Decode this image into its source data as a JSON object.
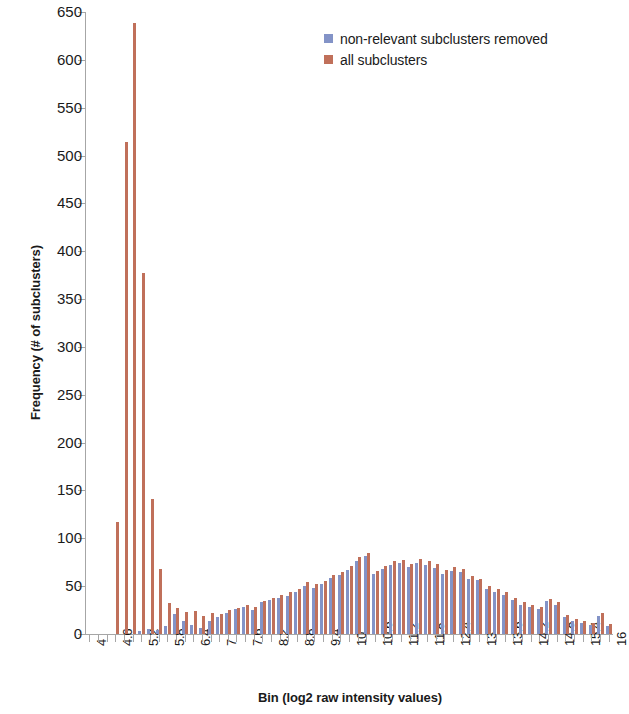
{
  "chart_data": {
    "type": "bar",
    "title": "",
    "xlabel": "Bin (log2 raw intensity values)",
    "ylabel": "Frequency (# of subclusters)",
    "ylim": [
      0,
      650
    ],
    "ytick_step": 50,
    "yticks": [
      0,
      50,
      100,
      150,
      200,
      250,
      300,
      350,
      400,
      450,
      500,
      550,
      600,
      650
    ],
    "grid": false,
    "legend_position": "top-center-right",
    "bin_start": 4.0,
    "bin_step": 0.2,
    "xtick_label_every": 3,
    "xtick_labels": [
      "4",
      "4.6",
      "5.2",
      "5.8",
      "6.4",
      "7",
      "7.6",
      "8.2",
      "8.8",
      "9.4",
      "10",
      "10.6",
      "11.2",
      "11.8",
      "12.4",
      "13",
      "13.6",
      "14.2",
      "14.8",
      "15.4",
      "16"
    ],
    "categories": [
      "4",
      "4.2",
      "4.4",
      "4.6",
      "4.8",
      "5",
      "5.2",
      "5.4",
      "5.6",
      "5.8",
      "6",
      "6.2",
      "6.4",
      "6.6",
      "6.8",
      "7",
      "7.2",
      "7.4",
      "7.6",
      "7.8",
      "8",
      "8.2",
      "8.4",
      "8.6",
      "8.8",
      "9",
      "9.2",
      "9.4",
      "9.6",
      "9.8",
      "10",
      "10.2",
      "10.4",
      "10.6",
      "10.8",
      "11",
      "11.2",
      "11.4",
      "11.6",
      "11.8",
      "12",
      "12.2",
      "12.4",
      "12.6",
      "12.8",
      "13",
      "13.2",
      "13.4",
      "13.6",
      "13.8",
      "14",
      "14.2",
      "14.4",
      "14.6",
      "14.8",
      "15",
      "15.2",
      "15.4",
      "15.6",
      "15.8",
      "16"
    ],
    "series": [
      {
        "name": "non-relevant subclusters removed",
        "color": "#8393c7",
        "values": [
          0,
          0,
          0,
          0,
          0,
          0,
          3,
          5,
          4,
          8,
          21,
          14,
          9,
          6,
          14,
          18,
          22,
          26,
          28,
          25,
          33,
          36,
          38,
          40,
          44,
          50,
          48,
          52,
          59,
          62,
          67,
          76,
          82,
          63,
          68,
          72,
          74,
          70,
          74,
          72,
          69,
          63,
          66,
          65,
          58,
          56,
          47,
          44,
          41,
          36,
          30,
          28,
          26,
          34,
          30,
          18,
          14,
          12,
          9,
          19,
          8
        ]
      },
      {
        "name": "all subclusters",
        "color": "#c0705a",
        "values": [
          0,
          0,
          0,
          117,
          514,
          638,
          377,
          141,
          68,
          32,
          27,
          23,
          24,
          19,
          22,
          21,
          25,
          27,
          30,
          28,
          35,
          38,
          41,
          44,
          47,
          54,
          52,
          55,
          62,
          65,
          71,
          80,
          85,
          66,
          71,
          76,
          77,
          73,
          78,
          76,
          73,
          67,
          70,
          68,
          61,
          58,
          50,
          47,
          44,
          38,
          33,
          30,
          28,
          37,
          33,
          20,
          16,
          14,
          11,
          22,
          10
        ]
      }
    ]
  },
  "legend": {
    "entries": [
      {
        "label": "non-relevant subclusters removed",
        "color": "#8393c7"
      },
      {
        "label": "all subclusters",
        "color": "#c0705a"
      }
    ]
  },
  "axes": {
    "x_title": "Bin (log2 raw intensity values)",
    "y_title": "Frequency (# of subclusters)"
  }
}
